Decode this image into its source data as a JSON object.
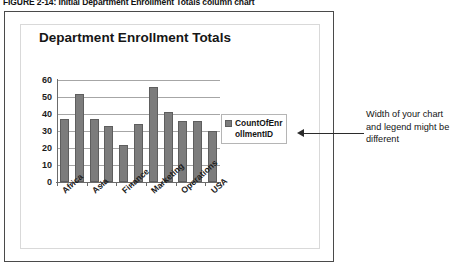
{
  "caption": "FIGURE 2-14: Initial Department Enrollment Totals column chart",
  "chart_data": {
    "type": "bar",
    "title": "Department Enrollment Totals",
    "xlabel": "",
    "ylabel": "",
    "ylim": [
      0,
      60
    ],
    "yticks": [
      "0",
      "10",
      "20",
      "30",
      "40",
      "50",
      "60"
    ],
    "grid": true,
    "legend_position": "right",
    "categories": [
      "Africa",
      "Art",
      "Asia",
      "Biology",
      "Finance",
      "History",
      "Marketing",
      "Math",
      "Operations",
      "Science",
      "USA"
    ],
    "visible_tick_labels": [
      "Africa",
      "Asia",
      "Finance",
      "Marketing",
      "Operations",
      "USA"
    ],
    "series": [
      {
        "name": "CountOfEnrollmentID",
        "values": [
          37,
          52,
          37,
          33,
          22,
          34,
          56,
          41,
          36,
          36,
          30
        ],
        "color": "#7c7c7c"
      }
    ]
  },
  "legend": {
    "label": "CountOfEnrollmentID"
  },
  "annotation": {
    "text": "Width of your chart and legend might be different"
  }
}
